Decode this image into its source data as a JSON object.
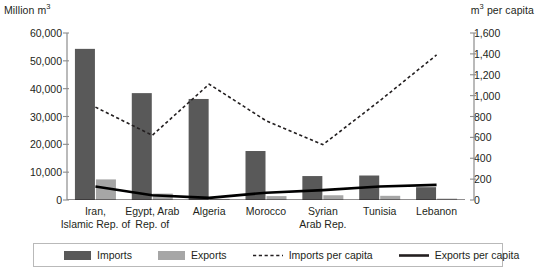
{
  "chart_data": {
    "type": "bar",
    "title": "",
    "categories": [
      "Iran,\nIslamic Rep. of",
      "Egypt, Arab\nRep. of",
      "Algeria",
      "Morocco",
      "Syrian\nArab Rep.",
      "Tunisia",
      "Lebanon"
    ],
    "category_lines": [
      [
        "Iran,",
        "Islamic Rep. of"
      ],
      [
        "Egypt, Arab",
        "Rep. of"
      ],
      [
        "Algeria",
        ""
      ],
      [
        "Morocco",
        ""
      ],
      [
        "Syrian",
        "Arab Rep."
      ],
      [
        "Tunisia",
        ""
      ],
      [
        "Lebanon",
        ""
      ]
    ],
    "series": [
      {
        "name": "Imports",
        "axis": "left",
        "kind": "bar",
        "color": "#595959",
        "values": [
          54300,
          38400,
          36300,
          17600,
          8600,
          8800,
          4600
        ]
      },
      {
        "name": "Exports",
        "axis": "left",
        "kind": "bar",
        "color": "#a6a6a6",
        "values": [
          7400,
          2300,
          400,
          1400,
          1700,
          1500,
          500
        ]
      },
      {
        "name": "Imports per capita",
        "axis": "right",
        "kind": "dashed-line",
        "color": "#231f20",
        "values": [
          890,
          620,
          1110,
          760,
          530,
          950,
          1390
        ]
      },
      {
        "name": "Exports per capita",
        "axis": "right",
        "kind": "solid-line",
        "color": "#000000",
        "values": [
          130,
          45,
          20,
          70,
          95,
          130,
          145
        ]
      }
    ],
    "ylabel_left": "Million m3",
    "ylabel_left_base": "Million m",
    "ylabel_left_sup": "3",
    "ylabel_right": "m3 per capita",
    "ylabel_right_base": "m",
    "ylabel_right_sup": "3",
    "ylabel_right_tail": " per capita",
    "ylim_left": [
      0,
      60000
    ],
    "ylim_right": [
      0,
      1600
    ],
    "yticks_left": [
      "0",
      "10,000",
      "20,000",
      "30,000",
      "40,000",
      "50,000",
      "60,000"
    ],
    "yticks_right": [
      "0",
      "200",
      "400",
      "600",
      "800",
      "1,000",
      "1,200",
      "1,400",
      "1,600"
    ],
    "grid": false,
    "legend_position": "bottom",
    "legend": [
      {
        "label": "Imports",
        "marker": "swatch-dark"
      },
      {
        "label": "Exports",
        "marker": "swatch-light"
      },
      {
        "label": "Imports per capita",
        "marker": "dashed-line"
      },
      {
        "label": "Exports per capita",
        "marker": "solid-line"
      }
    ]
  },
  "colors": {
    "imports_bar": "#595959",
    "exports_bar": "#a6a6a6",
    "axis": "#8c8c8c",
    "line_dark": "#231f20",
    "legend_border": "#b9b9b9",
    "background": "#ffffff"
  }
}
